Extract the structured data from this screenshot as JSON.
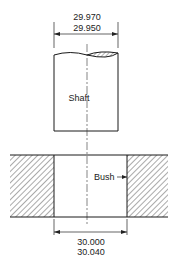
{
  "diagram": {
    "type": "shaft-and-bush fit drawing",
    "shaft": {
      "label": "Shaft",
      "dimension_upper": "29.970",
      "dimension_lower": "29.950"
    },
    "bush": {
      "label": "Bush",
      "dimension_upper": "30.000",
      "dimension_lower": "30.040"
    },
    "colors": {
      "line": "#1a1a1a",
      "hatch": "#555555",
      "background": "#ffffff"
    }
  }
}
